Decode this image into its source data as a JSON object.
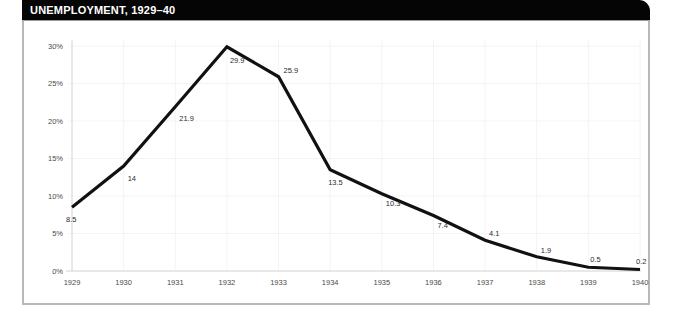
{
  "header": {
    "title": "UNEMPLOYMENT, 1929–40"
  },
  "colors": {
    "header_background": "#050505",
    "header_text": "#ffffff",
    "line": "#111111",
    "grid": "#f4f4f6",
    "frame_border": "#b8b8b8",
    "plot_background": "#ffffff",
    "tick_text": "#4a4a4a",
    "label_text": "#2c2c2c"
  },
  "chart_data": {
    "type": "line",
    "title": "UNEMPLOYMENT, 1929–40",
    "xlabel": "",
    "ylabel": "",
    "categories": [
      "1929",
      "1930",
      "1931",
      "1932",
      "1933",
      "1934",
      "1935",
      "1936",
      "1937",
      "1938",
      "1939",
      "1940"
    ],
    "values": [
      8.5,
      14,
      21.9,
      29.9,
      25.9,
      13.5,
      10.3,
      7.4,
      4.1,
      1.9,
      0.5,
      0.2
    ],
    "point_labels": [
      "8.5",
      "14",
      "21.9",
      "29.9",
      "25.9",
      "13.5",
      "10.3",
      "7.4",
      "4.1",
      "1.9",
      "0.5",
      "0.2"
    ],
    "ylim": [
      0,
      30
    ],
    "ytick_values": [
      0,
      5,
      10,
      15,
      20,
      25,
      30
    ],
    "ytick_labels": [
      "0%",
      "5%",
      "10%",
      "15%",
      "20%",
      "25%",
      "30%"
    ],
    "xtick_labels": [
      "1929",
      "1930",
      "1931",
      "1932",
      "1933",
      "1934",
      "1935",
      "1936",
      "1937",
      "1938",
      "1939",
      "1940"
    ],
    "grid": true,
    "legend": false,
    "series": [
      {
        "name": "Unemployment rate",
        "values": [
          8.5,
          14,
          21.9,
          29.9,
          25.9,
          13.5,
          10.3,
          7.4,
          4.1,
          1.9,
          0.5,
          0.2
        ]
      }
    ]
  }
}
